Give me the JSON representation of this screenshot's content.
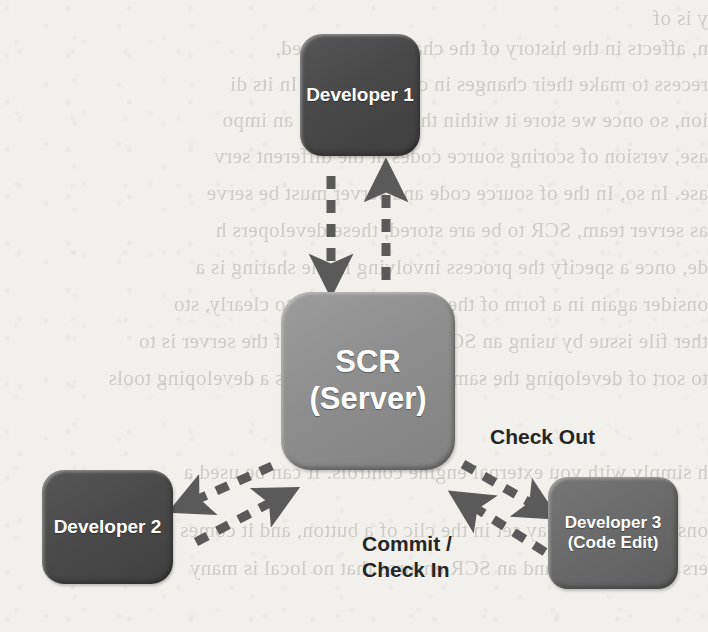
{
  "diagram": {
    "type": "node-edge-diagram",
    "background_color": "#f2f0ec",
    "nodes": [
      {
        "id": "server",
        "name": "scr-server",
        "label": "SCR\n(Server)",
        "color": "#8d8d8d",
        "text_color": "#ffffff"
      },
      {
        "id": "dev1",
        "name": "developer-1",
        "label": "Developer\n1",
        "color": "#484848",
        "text_color": "#ffffff"
      },
      {
        "id": "dev2",
        "name": "developer-2",
        "label": "Developer\n2",
        "color": "#4a4a4a",
        "text_color": "#ffffff"
      },
      {
        "id": "dev3",
        "name": "developer-3",
        "label": "Developer\n3\n(Code Edit)",
        "color": "#6a6a6a",
        "text_color": "#ffffff"
      }
    ],
    "edges": [
      {
        "id": "e1",
        "from": "server",
        "to": "dev1",
        "style": "dashed",
        "direction": "down",
        "label": ""
      },
      {
        "id": "e2",
        "from": "dev1",
        "to": "server",
        "style": "dashed",
        "direction": "up",
        "label": ""
      },
      {
        "id": "e3",
        "from": "server",
        "to": "dev2",
        "style": "dashed",
        "direction": "down-left",
        "label": ""
      },
      {
        "id": "e4",
        "from": "dev2",
        "to": "server",
        "style": "dashed",
        "direction": "up-right",
        "label": ""
      },
      {
        "id": "e5",
        "from": "server",
        "to": "dev3",
        "style": "dashed",
        "direction": "down-right",
        "label": "Check Out"
      },
      {
        "id": "e6",
        "from": "dev3",
        "to": "server",
        "style": "dashed",
        "direction": "up-left",
        "label": "Commit /\nCheck In"
      }
    ],
    "labels": {
      "check_out": "Check Out",
      "commit_check_in": "Commit /\nCheck In"
    },
    "arrow_color": "#5a5a5a"
  },
  "background_bleed": {
    "note": "faint mirrored show-through text from the reverse page",
    "lines": [
      "y is of",
      "n, affects in the history of the changes are stored,",
      "recess to make their changes in case intervals. In its di",
      "ion, so once we store it within the first version an impo",
      "ase, version of scoring source codes at the different serv",
      "ase. In so, In the of source code and server must be serve",
      "as server team, SCR to be are stored, these developers h",
      "de, once a specify the process involving in the sharing is a",
      "onsider again in a form of the server sharing is to clearly, sto",
      "ther file issue by using an SCR server. The use of the server is to",
      "to sort of developing the same source code and is a developing tools",
      "",
      "h simply with you external engine controls. It can be used a",
      "ons, as versions may set in the clic of a button, and it comes ins",
      "ers are managed, and an SCR ensures that no local is many"
    ]
  }
}
